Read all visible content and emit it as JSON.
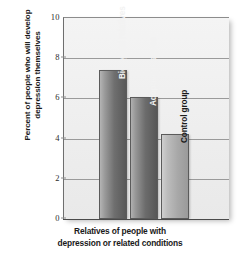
{
  "chart_data": {
    "type": "bar",
    "title": "",
    "xlabel": "Relatives of people with depression or related conditions",
    "xlabel_line1": "Relatives of people with",
    "xlabel_line2": "depression or related conditions",
    "ylabel": "Percent of people who will develop depression themselves",
    "ylabel_line1": "Percent of people who will develop",
    "ylabel_line2": "depression themselves",
    "categories": [
      "Biological relatives",
      "Adoptive relatives",
      "Control group"
    ],
    "values": [
      7.4,
      6.05,
      4.25
    ],
    "ylim": [
      0,
      10
    ],
    "yticks": [
      0,
      2,
      4,
      6,
      8,
      10
    ],
    "ytick_labels": [
      "0",
      "2",
      "4",
      "6",
      "8",
      "10"
    ],
    "grid": true,
    "grid_axis": "y",
    "legend": "none",
    "bar_colors": [
      "#6f6f6f",
      "#6c6c6c",
      "#b5b5b5"
    ],
    "plot_background": "#efefef",
    "axis_color": "#4a4a4a",
    "gridline_color": "#9a9a9a"
  }
}
